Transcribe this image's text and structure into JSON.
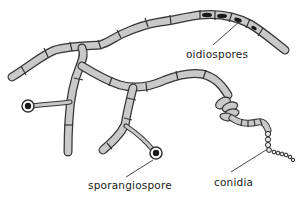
{
  "diagram": {
    "colors": {
      "hypha_fill": "#c9c9c9",
      "outline": "#333333",
      "spore_dark": "#1a1a1a",
      "background": "#ffffff"
    },
    "labels": {
      "oidiospores": "oidiospores",
      "sporangiospore": "sporangiospore",
      "conidia": "conidia"
    },
    "structures": [
      {
        "name": "oidiospores",
        "icon": "oval-spores-in-hyphal-cells"
      },
      {
        "name": "sporangiospore",
        "icon": "circle-with-dark-center-on-stalk"
      },
      {
        "name": "conidia",
        "icon": "chain-of-small-circles"
      }
    ]
  }
}
